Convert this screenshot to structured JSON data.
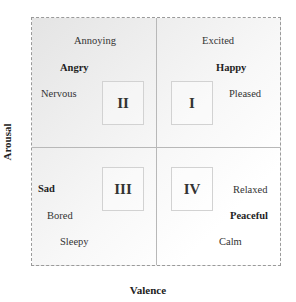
{
  "diagram": {
    "type": "valence-arousal circumplex quadrant diagram",
    "axes": {
      "x_label": "Valence",
      "y_label": "Arousal"
    },
    "quadrants": [
      {
        "id": "I",
        "label": "I",
        "position": "top-right",
        "words": [
          {
            "text": "Excited",
            "bold": false
          },
          {
            "text": "Happy",
            "bold": true
          },
          {
            "text": "Pleased",
            "bold": false
          }
        ]
      },
      {
        "id": "II",
        "label": "II",
        "position": "top-left",
        "words": [
          {
            "text": "Annoying",
            "bold": false
          },
          {
            "text": "Angry",
            "bold": true
          },
          {
            "text": "Nervous",
            "bold": false
          }
        ]
      },
      {
        "id": "III",
        "label": "III",
        "position": "bottom-left",
        "words": [
          {
            "text": "Sad",
            "bold": true
          },
          {
            "text": "Bored",
            "bold": false
          },
          {
            "text": "Sleepy",
            "bold": false
          }
        ]
      },
      {
        "id": "IV",
        "label": "IV",
        "position": "bottom-right",
        "words": [
          {
            "text": "Relaxed",
            "bold": false
          },
          {
            "text": "Peaceful",
            "bold": true
          },
          {
            "text": "Calm",
            "bold": false
          }
        ]
      }
    ],
    "colors": {
      "border": "#9a9a9a",
      "divider": "#b8b8b8",
      "gradient_start": "#e4e4e4",
      "gradient_end": "#ffffff"
    }
  }
}
